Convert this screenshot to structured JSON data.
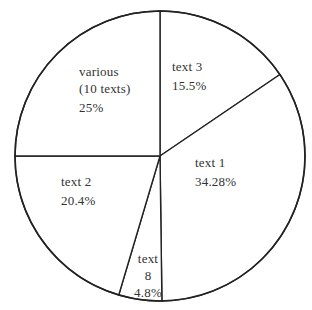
{
  "chart_data": {
    "type": "pie",
    "title": "",
    "start_angle_deg": 0,
    "direction": "clockwise",
    "categories": [
      "text 3",
      "text 1",
      "text 8",
      "text 2",
      "various (10 texts)"
    ],
    "values": [
      15.5,
      34.28,
      4.8,
      20.4,
      25
    ],
    "value_labels": [
      "15.5%",
      "34.28%",
      "4.8%",
      "20.4%",
      "25%"
    ],
    "slices": [
      {
        "label": "text 3",
        "value": 15.5,
        "display": "15.5%"
      },
      {
        "label": "text 1",
        "value": 34.28,
        "display": "34.28%"
      },
      {
        "label": "text 8",
        "value": 4.8,
        "display": "4.8%"
      },
      {
        "label": "text 2",
        "value": 20.4,
        "display": "20.4%"
      },
      {
        "label": "various (10 texts)",
        "value": 25,
        "display": "25%"
      }
    ],
    "legend": "none (labels inside slices)",
    "fill": "#ffffff",
    "stroke": "#222222"
  },
  "labels": {
    "various": {
      "line1": "various",
      "line2": "(10 texts)",
      "pct": "25%"
    },
    "text3": {
      "line1": "text 3",
      "pct": "15.5%"
    },
    "text1": {
      "line1": "text 1",
      "pct": "34.28%"
    },
    "text2": {
      "line1": "text 2",
      "pct": "20.4%"
    },
    "text8": {
      "line1": "text",
      "line2": "8",
      "pct": "4.8%"
    }
  },
  "geometry": {
    "cx": 160,
    "cy": 156,
    "r": 145
  }
}
